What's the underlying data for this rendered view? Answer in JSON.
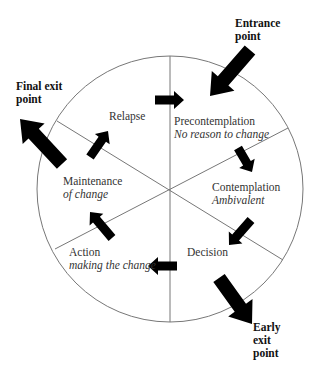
{
  "diagram": {
    "colors": {
      "line": "#777777",
      "arrow": "#000000",
      "text": "#333333",
      "background": "#ffffff"
    },
    "circle": {
      "cx": 170,
      "cy": 189,
      "r": 133
    },
    "spokes": [
      {
        "x1": 170,
        "y1": 56,
        "x2": 170,
        "y2": 322
      },
      {
        "x1": 57,
        "y1": 121,
        "x2": 283,
        "y2": 260
      },
      {
        "x1": 288,
        "y1": 128,
        "x2": 55,
        "y2": 249
      }
    ],
    "stages": [
      {
        "name": "Precontemplation",
        "subtitle": "No reason to change"
      },
      {
        "name": "Contemplation",
        "subtitle": "Ambivalent"
      },
      {
        "name": "Decision",
        "subtitle": ""
      },
      {
        "name": "Action",
        "subtitle": "making the change"
      },
      {
        "name": "Maintenance",
        "subtitle": "of change"
      },
      {
        "name": "Relapse",
        "subtitle": ""
      }
    ],
    "entry_exit": {
      "entrance": {
        "line1": "Entrance",
        "line2": "point"
      },
      "final_exit": {
        "line1": "Final exit",
        "line2": "point"
      },
      "early_exit": {
        "line1": "Early",
        "line2": "exit",
        "line3": "point"
      }
    },
    "arrows": {
      "big": [
        {
          "id": "entrance-arrow",
          "x1": 250,
          "y1": 50,
          "x2": 210,
          "y2": 96
        },
        {
          "id": "final-exit-arrow",
          "x1": 62,
          "y1": 164,
          "x2": 20,
          "y2": 119
        },
        {
          "id": "early-exit-arrow",
          "x1": 219,
          "y1": 278,
          "x2": 252,
          "y2": 324
        }
      ],
      "small": [
        {
          "id": "relapse-to-precontemplation",
          "x1": 155,
          "y1": 100,
          "x2": 184,
          "y2": 100
        },
        {
          "id": "precontemplation-to-contemplation",
          "x1": 238,
          "y1": 148,
          "x2": 252,
          "y2": 172
        },
        {
          "id": "contemplation-to-decision",
          "x1": 251,
          "y1": 220,
          "x2": 229,
          "y2": 245
        },
        {
          "id": "decision-to-action",
          "x1": 177,
          "y1": 266,
          "x2": 148,
          "y2": 266
        },
        {
          "id": "action-to-maintenance",
          "x1": 112,
          "y1": 238,
          "x2": 90,
          "y2": 212
        },
        {
          "id": "maintenance-to-relapse",
          "x1": 90,
          "y1": 157,
          "x2": 108,
          "y2": 131
        }
      ]
    }
  }
}
